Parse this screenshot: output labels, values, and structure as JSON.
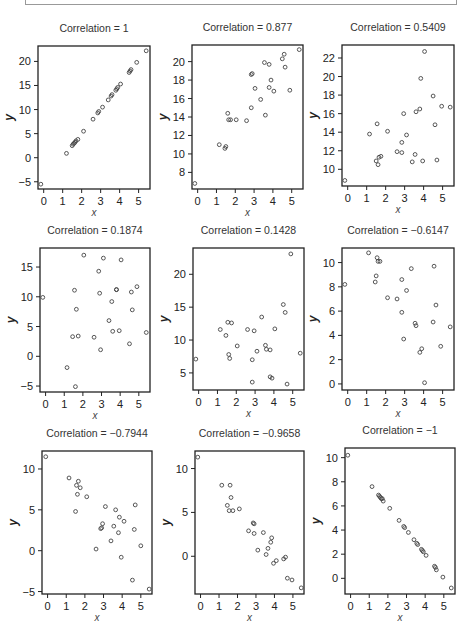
{
  "chart_data": [
    {
      "type": "scatter",
      "title": "Correlation = 1",
      "xlabel": "x",
      "ylabel": "y",
      "xticks": [
        0,
        1,
        2,
        3,
        4,
        5
      ],
      "yticks": [
        -5,
        0,
        5,
        10,
        15,
        20
      ],
      "xlim": [
        -0.3,
        5.6
      ],
      "ylim": [
        -6.5,
        23.2
      ],
      "box": [
        38,
        46,
        150,
        189
      ],
      "points": [
        [
          -0.15,
          -5.5
        ],
        [
          1.2,
          0.9
        ],
        [
          1.5,
          2.5
        ],
        [
          1.55,
          2.8
        ],
        [
          1.6,
          3.0
        ],
        [
          1.65,
          3.2
        ],
        [
          1.7,
          3.5
        ],
        [
          1.8,
          3.8
        ],
        [
          2.1,
          5.5
        ],
        [
          2.6,
          8.0
        ],
        [
          2.85,
          9.3
        ],
        [
          2.9,
          9.6
        ],
        [
          3.1,
          10.5
        ],
        [
          3.4,
          12.0
        ],
        [
          3.55,
          12.8
        ],
        [
          3.6,
          13.1
        ],
        [
          3.8,
          14.0
        ],
        [
          3.85,
          14.3
        ],
        [
          3.9,
          14.6
        ],
        [
          4.05,
          15.3
        ],
        [
          4.5,
          17.7
        ],
        [
          4.55,
          18.0
        ],
        [
          4.6,
          18.3
        ],
        [
          4.9,
          19.8
        ],
        [
          5.4,
          22.2
        ]
      ]
    },
    {
      "type": "scatter",
      "title": "Correlation = 0.877",
      "xlabel": "x",
      "ylabel": "y",
      "xticks": [
        0,
        1,
        2,
        3,
        4,
        5
      ],
      "yticks": [
        8,
        10,
        12,
        14,
        16,
        18,
        20
      ],
      "xlim": [
        -0.3,
        5.6
      ],
      "ylim": [
        6.2,
        21.8
      ],
      "box": [
        192,
        45,
        303,
        189
      ],
      "points": [
        [
          -0.15,
          6.8
        ],
        [
          1.15,
          11.0
        ],
        [
          1.45,
          10.6
        ],
        [
          1.5,
          10.8
        ],
        [
          1.6,
          14.4
        ],
        [
          1.65,
          13.7
        ],
        [
          1.75,
          13.7
        ],
        [
          2.05,
          13.7
        ],
        [
          2.6,
          13.6
        ],
        [
          2.85,
          15.0
        ],
        [
          2.85,
          18.6
        ],
        [
          2.9,
          18.7
        ],
        [
          3.05,
          17.1
        ],
        [
          3.35,
          15.9
        ],
        [
          3.55,
          19.9
        ],
        [
          3.6,
          14.2
        ],
        [
          3.8,
          19.7
        ],
        [
          3.8,
          17.2
        ],
        [
          3.9,
          18.0
        ],
        [
          4.05,
          16.8
        ],
        [
          4.5,
          20.3
        ],
        [
          4.6,
          20.8
        ],
        [
          4.65,
          19.4
        ],
        [
          4.9,
          16.9
        ],
        [
          5.4,
          21.3
        ]
      ]
    },
    {
      "type": "scatter",
      "title": "Correlation = 0.5409",
      "xlabel": "x",
      "ylabel": "y",
      "xticks": [
        0,
        1,
        2,
        3,
        4,
        5
      ],
      "yticks": [
        10,
        12,
        14,
        16,
        18,
        20,
        22
      ],
      "xlim": [
        -0.3,
        5.6
      ],
      "ylim": [
        8.2,
        23.4
      ],
      "box": [
        342,
        45,
        454,
        186
      ],
      "points": [
        [
          -0.15,
          8.8
        ],
        [
          1.15,
          13.8
        ],
        [
          1.5,
          10.9
        ],
        [
          1.55,
          14.9
        ],
        [
          1.6,
          10.5
        ],
        [
          1.65,
          11.3
        ],
        [
          1.75,
          11.4
        ],
        [
          2.1,
          14.1
        ],
        [
          2.6,
          11.9
        ],
        [
          2.85,
          11.8
        ],
        [
          2.85,
          12.9
        ],
        [
          2.95,
          16.0
        ],
        [
          3.1,
          13.7
        ],
        [
          3.4,
          10.8
        ],
        [
          3.55,
          11.6
        ],
        [
          3.6,
          16.2
        ],
        [
          3.8,
          16.5
        ],
        [
          3.85,
          19.8
        ],
        [
          3.95,
          10.9
        ],
        [
          4.05,
          22.7
        ],
        [
          4.5,
          17.9
        ],
        [
          4.6,
          14.8
        ],
        [
          4.7,
          11.0
        ],
        [
          4.95,
          16.8
        ],
        [
          5.4,
          16.7
        ]
      ]
    },
    {
      "type": "scatter",
      "title": "Correlation = 0.1874",
      "xlabel": "x",
      "ylabel": "y",
      "xticks": [
        0,
        1,
        2,
        3,
        4,
        5
      ],
      "yticks": [
        -5,
        0,
        5,
        10,
        15
      ],
      "xlim": [
        -0.3,
        5.6
      ],
      "ylim": [
        -6.0,
        18.2
      ],
      "box": [
        40,
        248,
        150,
        392
      ],
      "points": [
        [
          -0.15,
          9.9
        ],
        [
          1.15,
          -1.9
        ],
        [
          1.45,
          3.3
        ],
        [
          1.55,
          11.1
        ],
        [
          1.6,
          -5.1
        ],
        [
          1.65,
          7.9
        ],
        [
          1.75,
          3.4
        ],
        [
          2.05,
          17.0
        ],
        [
          2.6,
          3.2
        ],
        [
          2.85,
          14.3
        ],
        [
          2.9,
          10.6
        ],
        [
          2.95,
          1.1
        ],
        [
          3.1,
          16.5
        ],
        [
          3.4,
          6.0
        ],
        [
          3.55,
          9.2
        ],
        [
          3.6,
          4.2
        ],
        [
          3.8,
          11.2
        ],
        [
          3.8,
          11.2
        ],
        [
          3.95,
          4.3
        ],
        [
          4.05,
          16.2
        ],
        [
          4.5,
          2.1
        ],
        [
          4.6,
          10.8
        ],
        [
          4.65,
          7.8
        ],
        [
          4.9,
          11.7
        ],
        [
          5.4,
          4.0
        ]
      ]
    },
    {
      "type": "scatter",
      "title": "Correlation = 0.1428",
      "xlabel": "x",
      "ylabel": "y",
      "xticks": [
        0,
        1,
        2,
        3,
        4,
        5
      ],
      "yticks": [
        5,
        10,
        15,
        20
      ],
      "xlim": [
        -0.3,
        5.6
      ],
      "ylim": [
        2.4,
        24.0
      ],
      "box": [
        193,
        248,
        304,
        390
      ],
      "points": [
        [
          -0.15,
          7.1
        ],
        [
          1.15,
          11.6
        ],
        [
          1.45,
          10.7
        ],
        [
          1.55,
          12.7
        ],
        [
          1.6,
          7.8
        ],
        [
          1.65,
          7.2
        ],
        [
          1.75,
          12.6
        ],
        [
          2.05,
          9.1
        ],
        [
          2.6,
          11.6
        ],
        [
          2.85,
          7.0
        ],
        [
          2.85,
          3.6
        ],
        [
          2.95,
          11.4
        ],
        [
          3.1,
          8.3
        ],
        [
          3.35,
          13.5
        ],
        [
          3.55,
          9.2
        ],
        [
          3.6,
          8.6
        ],
        [
          3.8,
          8.5
        ],
        [
          3.8,
          4.4
        ],
        [
          3.9,
          4.2
        ],
        [
          4.05,
          11.7
        ],
        [
          4.5,
          15.4
        ],
        [
          4.6,
          14.2
        ],
        [
          4.7,
          3.3
        ],
        [
          4.9,
          23.1
        ],
        [
          5.4,
          8.0
        ]
      ]
    },
    {
      "type": "scatter",
      "title": "Correlation = −0.6147",
      "xlabel": "x",
      "ylabel": "y",
      "xticks": [
        0,
        1,
        2,
        3,
        4,
        5
      ],
      "yticks": [
        0,
        2,
        4,
        6,
        8,
        10
      ],
      "xlim": [
        -0.3,
        5.6
      ],
      "ylim": [
        -0.5,
        11.2
      ],
      "box": [
        342,
        248,
        454,
        390
      ],
      "points": [
        [
          -0.15,
          8.2
        ],
        [
          1.1,
          10.8
        ],
        [
          1.45,
          8.4
        ],
        [
          1.5,
          8.9
        ],
        [
          1.55,
          10.4
        ],
        [
          1.6,
          10.1
        ],
        [
          1.7,
          10.1
        ],
        [
          2.1,
          7.1
        ],
        [
          2.6,
          7.0
        ],
        [
          2.85,
          8.6
        ],
        [
          2.85,
          5.9
        ],
        [
          2.95,
          3.7
        ],
        [
          3.1,
          7.7
        ],
        [
          3.35,
          9.5
        ],
        [
          3.55,
          5.0
        ],
        [
          3.6,
          4.8
        ],
        [
          3.8,
          2.6
        ],
        [
          3.9,
          2.9
        ],
        [
          4.05,
          0.1
        ],
        [
          4.5,
          5.1
        ],
        [
          4.55,
          9.7
        ],
        [
          4.65,
          6.5
        ],
        [
          4.9,
          3.1
        ],
        [
          5.4,
          4.7
        ]
      ]
    },
    {
      "type": "scatter",
      "title": "Correlation = −0.7944",
      "xlabel": "x",
      "ylabel": "y",
      "xticks": [
        0,
        1,
        2,
        3,
        4,
        5
      ],
      "yticks": [
        -5,
        0,
        5,
        10
      ],
      "xlim": [
        -0.3,
        5.6
      ],
      "ylim": [
        -5.3,
        12.2
      ],
      "box": [
        42,
        451,
        152,
        594
      ],
      "points": [
        [
          -0.1,
          11.5
        ],
        [
          1.15,
          8.9
        ],
        [
          1.5,
          4.8
        ],
        [
          1.55,
          8.0
        ],
        [
          1.6,
          6.9
        ],
        [
          1.65,
          8.5
        ],
        [
          1.75,
          7.7
        ],
        [
          2.1,
          6.6
        ],
        [
          2.6,
          0.2
        ],
        [
          2.85,
          2.7
        ],
        [
          2.9,
          2.8
        ],
        [
          2.95,
          3.3
        ],
        [
          3.1,
          5.4
        ],
        [
          3.4,
          1.2
        ],
        [
          3.55,
          3.0
        ],
        [
          3.65,
          5.0
        ],
        [
          3.8,
          2.2
        ],
        [
          3.85,
          4.1
        ],
        [
          3.95,
          -0.8
        ],
        [
          4.1,
          3.6
        ],
        [
          4.55,
          -3.6
        ],
        [
          4.65,
          2.6
        ],
        [
          4.7,
          5.6
        ],
        [
          5.0,
          0.6
        ],
        [
          5.45,
          -4.7
        ]
      ]
    },
    {
      "type": "scatter",
      "title": "Correlation = −0.9658",
      "xlabel": "x",
      "ylabel": "y",
      "xticks": [
        0,
        1,
        2,
        3,
        4,
        5
      ],
      "yticks": [
        0,
        5,
        10
      ],
      "xlim": [
        -0.3,
        5.6
      ],
      "ylim": [
        -4.3,
        12.0
      ],
      "box": [
        195,
        451,
        304,
        594
      ],
      "points": [
        [
          -0.15,
          11.3
        ],
        [
          1.15,
          8.1
        ],
        [
          1.45,
          5.8
        ],
        [
          1.55,
          5.2
        ],
        [
          1.6,
          8.1
        ],
        [
          1.65,
          6.7
        ],
        [
          1.75,
          5.2
        ],
        [
          2.1,
          5.4
        ],
        [
          2.6,
          2.9
        ],
        [
          2.85,
          3.8
        ],
        [
          2.9,
          3.7
        ],
        [
          2.9,
          2.6
        ],
        [
          3.1,
          0.7
        ],
        [
          3.4,
          2.7
        ],
        [
          3.55,
          0.2
        ],
        [
          3.65,
          0.9
        ],
        [
          3.8,
          1.6
        ],
        [
          3.85,
          2.1
        ],
        [
          3.95,
          -0.8
        ],
        [
          4.1,
          -0.5
        ],
        [
          4.5,
          -0.3
        ],
        [
          4.6,
          -0.1
        ],
        [
          4.7,
          -2.5
        ],
        [
          4.95,
          -2.7
        ],
        [
          5.45,
          -3.6
        ]
      ]
    },
    {
      "type": "scatter",
      "title": "Correlation = −1",
      "xlabel": "x",
      "ylabel": "y",
      "xticks": [
        0,
        1,
        2,
        3,
        4,
        5
      ],
      "yticks": [
        0,
        2,
        4,
        6,
        8,
        10
      ],
      "xlim": [
        -0.3,
        5.6
      ],
      "ylim": [
        -1.3,
        10.8
      ],
      "box": [
        345,
        448,
        455,
        594
      ],
      "points": [
        [
          -0.15,
          10.2
        ],
        [
          1.15,
          7.6
        ],
        [
          1.5,
          6.9
        ],
        [
          1.55,
          6.8
        ],
        [
          1.6,
          6.7
        ],
        [
          1.65,
          6.6
        ],
        [
          1.7,
          6.6
        ],
        [
          1.75,
          6.4
        ],
        [
          2.1,
          5.8
        ],
        [
          2.6,
          4.8
        ],
        [
          2.85,
          4.3
        ],
        [
          2.9,
          4.2
        ],
        [
          3.1,
          3.8
        ],
        [
          3.4,
          3.2
        ],
        [
          3.55,
          2.9
        ],
        [
          3.6,
          2.8
        ],
        [
          3.8,
          2.4
        ],
        [
          3.85,
          2.3
        ],
        [
          3.9,
          2.2
        ],
        [
          4.05,
          1.9
        ],
        [
          4.5,
          1.0
        ],
        [
          4.55,
          0.9
        ],
        [
          4.6,
          0.7
        ],
        [
          4.95,
          0.1
        ],
        [
          5.4,
          -0.8
        ]
      ]
    }
  ]
}
